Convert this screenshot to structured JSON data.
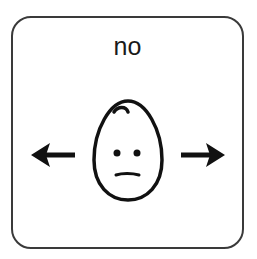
{
  "card": {
    "label": "no",
    "symbol": "face-neutral-head-shake",
    "icons": [
      "arrow-left-icon",
      "face-icon",
      "arrow-right-icon"
    ],
    "colors": {
      "border": "#3a3a3a",
      "ink": "#111111",
      "background": "#ffffff"
    }
  }
}
